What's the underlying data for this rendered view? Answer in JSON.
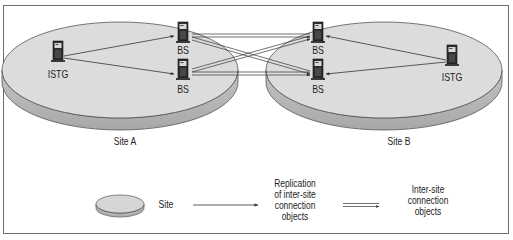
{
  "diagram": {
    "type": "inter-site replication topology",
    "sites": [
      {
        "id": "site-a",
        "label": "Site A",
        "servers": [
          {
            "id": "istg-a",
            "label": "ISTG",
            "role": "Inter-Site Topology Generator"
          },
          {
            "id": "bs-a1",
            "label": "BS",
            "role": "Bridgehead Server"
          },
          {
            "id": "bs-a2",
            "label": "BS",
            "role": "Bridgehead Server"
          }
        ]
      },
      {
        "id": "site-b",
        "label": "Site B",
        "servers": [
          {
            "id": "bs-b1",
            "label": "BS",
            "role": "Bridgehead Server"
          },
          {
            "id": "bs-b2",
            "label": "BS",
            "role": "Bridgehead Server"
          },
          {
            "id": "istg-b",
            "label": "ISTG",
            "role": "Inter-Site Topology Generator"
          }
        ]
      }
    ],
    "edges": [
      {
        "from": "istg-a",
        "to": "bs-a1",
        "kind": "replication"
      },
      {
        "from": "istg-a",
        "to": "bs-a2",
        "kind": "replication"
      },
      {
        "from": "istg-b",
        "to": "bs-b1",
        "kind": "replication"
      },
      {
        "from": "istg-b",
        "to": "bs-b2",
        "kind": "replication"
      },
      {
        "from": "bs-a1",
        "to": "bs-b1",
        "kind": "inter-site-connection"
      },
      {
        "from": "bs-a1",
        "to": "bs-b2",
        "kind": "inter-site-connection"
      },
      {
        "from": "bs-a2",
        "to": "bs-b1",
        "kind": "inter-site-connection"
      },
      {
        "from": "bs-a2",
        "to": "bs-b2",
        "kind": "inter-site-connection"
      }
    ]
  },
  "labels": {
    "istg_a": "ISTG",
    "bs_a1": "BS",
    "bs_a2": "BS",
    "bs_b1": "BS",
    "bs_b2": "BS",
    "istg_b": "ISTG",
    "site_a": "Site A",
    "site_b": "Site B"
  },
  "legend": {
    "site": "Site",
    "replication_line1": "Replication",
    "replication_line2": "of inter-site",
    "replication_line3": "connection",
    "replication_line4": "objects",
    "intersite_line1": "Inter-site",
    "intersite_line2": "connection",
    "intersite_line3": "objects"
  },
  "colors": {
    "site_top": "#dcdcdc",
    "site_side": "#b4b4b4",
    "outline": "#555555",
    "line": "#333333",
    "frame": "#6e6e6e"
  }
}
